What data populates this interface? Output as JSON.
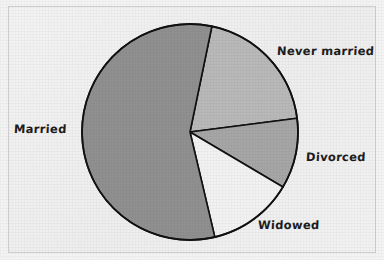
{
  "figure": {
    "width": 384,
    "height": 260,
    "background_color": "#f1f1f1",
    "frame_color": "#cfcfcf",
    "outline_color": "#111111"
  },
  "chart_data": {
    "type": "pie",
    "title": "",
    "subtitle": "",
    "xlabel": "",
    "ylabel": "",
    "grid": false,
    "legend_position": "outside-labels",
    "center": {
      "x": 190,
      "y": 132
    },
    "radius": 108,
    "start_angle_deg": -78.3,
    "direction": "clockwise",
    "categories": [
      "Never married",
      "Divorced",
      "Widowed",
      "Married"
    ],
    "values": [
      19.7,
      10.5,
      12.8,
      57.0
    ],
    "slice_angles_deg": [
      71.0,
      37.9,
      46.1,
      205.0
    ],
    "colors": [
      "#b9b9b9",
      "#a6a6a6",
      "#f2f2f2",
      "#909090"
    ],
    "annotations": [],
    "slices": [
      {
        "label": "Never married",
        "value": 19.7,
        "color": "#b9b9b9",
        "start_deg": -78.3,
        "end_deg": -7.3,
        "label_x": 277,
        "label_y": 44
      },
      {
        "label": "Divorced",
        "value": 10.5,
        "color": "#a6a6a6",
        "start_deg": -7.3,
        "end_deg": 30.6,
        "label_x": 306,
        "label_y": 150
      },
      {
        "label": "Widowed",
        "value": 12.8,
        "color": "#f2f2f2",
        "start_deg": 30.6,
        "end_deg": 76.7,
        "label_x": 258,
        "label_y": 218
      },
      {
        "label": "Married",
        "value": 57.0,
        "color": "#909090",
        "start_deg": 76.7,
        "end_deg": 281.7,
        "label_x": 14,
        "label_y": 122
      }
    ]
  }
}
